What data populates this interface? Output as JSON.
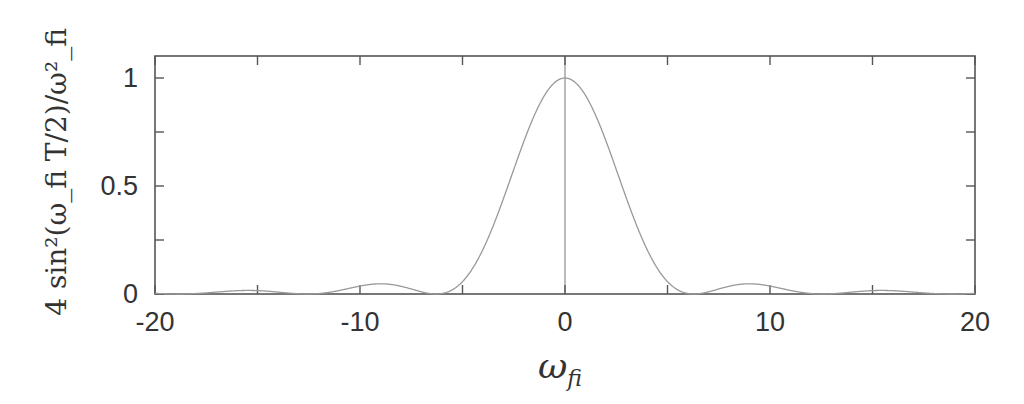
{
  "chart_data": {
    "type": "line",
    "title": "",
    "xlabel": "ω_fi",
    "ylabel": "4 sin²(ω_fi T/2)/ω_fi²",
    "xlim": [
      -20,
      20
    ],
    "ylim": [
      0,
      1.1
    ],
    "grid": false,
    "legend": null,
    "x_ticks": [
      -20,
      -10,
      0,
      10,
      20
    ],
    "x_tick_labels": [
      "-20",
      "-10",
      "0",
      "10",
      "20"
    ],
    "x_minor_ticks": [
      -15,
      -5,
      5,
      15
    ],
    "y_ticks": [
      0,
      0.5,
      1
    ],
    "y_tick_labels": [
      "0",
      "0.5",
      "1"
    ],
    "y_minor_ticks": [
      0.25,
      0.75
    ],
    "annotations": [
      {
        "type": "vertical-line",
        "x": 0,
        "description": "vertical reference line at ω_fi = 0"
      }
    ],
    "series": [
      {
        "name": "4 sin²(ω_fi T/2)/ω_fi² (T = 1)",
        "function": "4*sin(x/2)^2/x^2",
        "x": [
          -20,
          -18.85,
          -17,
          -15.7,
          -14.5,
          -12.57,
          -11,
          -9.0,
          -7.5,
          -6.28,
          -5,
          -4,
          -3,
          -2,
          -1,
          0,
          1,
          2,
          3,
          4,
          5,
          6.28,
          7.5,
          9.0,
          11,
          12.57,
          14.5,
          15.7,
          17,
          18.85,
          20
        ],
        "y": [
          0.007,
          0.0,
          0.0089,
          0.0162,
          0.0163,
          0.0,
          0.0166,
          0.0481,
          0.0308,
          0.0,
          0.0575,
          0.2067,
          0.4431,
          0.7081,
          0.9194,
          1.0,
          0.9194,
          0.7081,
          0.4431,
          0.2067,
          0.0575,
          0.0,
          0.0308,
          0.0481,
          0.0166,
          0.0,
          0.0163,
          0.0162,
          0.0089,
          0.0,
          0.007
        ],
        "color": "#999999"
      }
    ],
    "zeros": [
      -18.85,
      -12.57,
      -6.28,
      6.28,
      12.57,
      18.85
    ],
    "peak": {
      "x": 0,
      "y": 1
    },
    "frame_color": "#555555"
  },
  "labels": {
    "x_axis_title_main": "ω",
    "x_axis_title_sub": "fi",
    "y_axis_title": "4 sin²(ω_fi T/2)/ω²_fi",
    "tick_x_0": "-20",
    "tick_x_1": "-10",
    "tick_x_2": "0",
    "tick_x_3": "10",
    "tick_x_4": "20",
    "tick_y_0": "0",
    "tick_y_1": "0.5",
    "tick_y_2": "1"
  }
}
